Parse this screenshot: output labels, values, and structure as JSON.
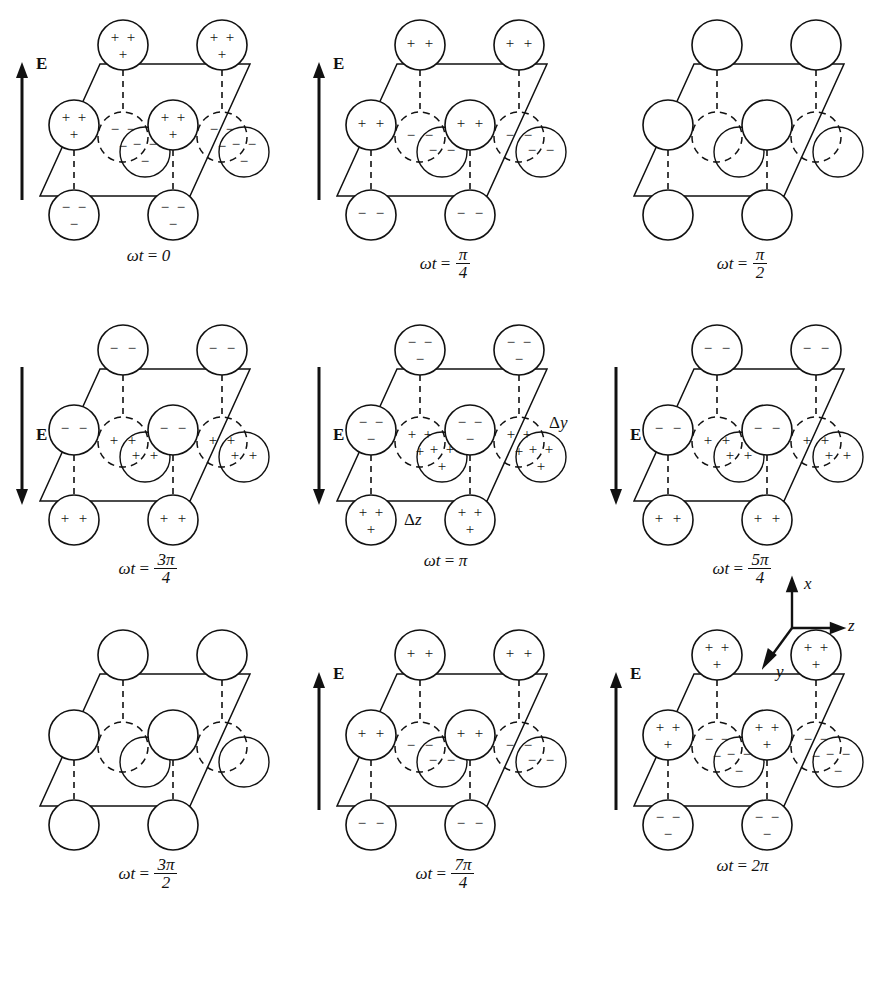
{
  "figure": {
    "type": "physics-lattice-diagram",
    "panel_count": 9,
    "rows": 3,
    "columns": 3,
    "line_color": "#111111",
    "background": "#ffffff"
  },
  "axes_triad": {
    "name": "coordinate-triad",
    "x_label": "x",
    "y_label": "y",
    "z_label": "z",
    "x_direction": "up",
    "z_direction": "right",
    "y_direction": "down-left"
  },
  "legend": {
    "field_symbol": "E",
    "delta_y": "Δy",
    "delta_z": "Δz"
  },
  "panels": [
    {
      "id": "panel-1",
      "phase_label": "ωt = 0",
      "phase_prefix": "ωt",
      "phase_eq": "=",
      "phase_value": "0",
      "phase_numerator": "",
      "phase_denominator": "",
      "field": {
        "shown": true,
        "direction": "up",
        "label": "E",
        "magnitude": "max"
      },
      "charge_magnitude": 3,
      "solid_charge": "+",
      "dashed_charge": "−",
      "solid_glyphs": [
        "+",
        "+",
        "+"
      ],
      "dashed_glyphs": [
        "−",
        "−",
        "−"
      ],
      "bottom_solid_glyphs": [
        "−",
        "−",
        "−"
      ],
      "annotations": []
    },
    {
      "id": "panel-2",
      "phase_label": "ωt = π/4",
      "phase_prefix": "ωt",
      "phase_eq": "=",
      "phase_value": "",
      "phase_numerator": "π",
      "phase_denominator": "4",
      "field": {
        "shown": true,
        "direction": "up",
        "label": "E",
        "magnitude": "mid"
      },
      "charge_magnitude": 2,
      "solid_charge": "+",
      "dashed_charge": "−",
      "solid_glyphs": [
        "+",
        "+"
      ],
      "dashed_glyphs": [
        "−",
        "−"
      ],
      "bottom_solid_glyphs": [
        "−",
        "−"
      ],
      "annotations": []
    },
    {
      "id": "panel-3",
      "phase_label": "ωt = π/2",
      "phase_prefix": "ωt",
      "phase_eq": "=",
      "phase_value": "",
      "phase_numerator": "π",
      "phase_denominator": "2",
      "field": {
        "shown": false,
        "direction": "none",
        "label": "",
        "magnitude": "zero"
      },
      "charge_magnitude": 0,
      "solid_charge": "",
      "dashed_charge": "",
      "solid_glyphs": [],
      "dashed_glyphs": [],
      "bottom_solid_glyphs": [],
      "annotations": []
    },
    {
      "id": "panel-4",
      "phase_label": "ωt = 3π/4",
      "phase_prefix": "ωt",
      "phase_eq": "=",
      "phase_value": "",
      "phase_numerator": "3π",
      "phase_denominator": "4",
      "field": {
        "shown": true,
        "direction": "down",
        "label": "E",
        "magnitude": "mid"
      },
      "charge_magnitude": 2,
      "solid_charge": "−",
      "dashed_charge": "+",
      "solid_glyphs": [
        "−",
        "−"
      ],
      "dashed_glyphs": [
        "+",
        "+"
      ],
      "bottom_solid_glyphs": [
        "+",
        "+"
      ],
      "annotations": []
    },
    {
      "id": "panel-5",
      "phase_label": "ωt = π",
      "phase_prefix": "ωt",
      "phase_eq": "=",
      "phase_value": "π",
      "phase_numerator": "",
      "phase_denominator": "",
      "field": {
        "shown": true,
        "direction": "down",
        "label": "E",
        "magnitude": "max"
      },
      "charge_magnitude": 3,
      "solid_charge": "−",
      "dashed_charge": "+",
      "solid_glyphs": [
        "−",
        "−",
        "−"
      ],
      "dashed_glyphs": [
        "+",
        "+",
        "+"
      ],
      "bottom_solid_glyphs": [
        "+",
        "+",
        "+"
      ],
      "annotations": [
        "Δy",
        "Δz"
      ]
    },
    {
      "id": "panel-6",
      "phase_label": "ωt = 5π/4",
      "phase_prefix": "ωt",
      "phase_eq": "=",
      "phase_value": "",
      "phase_numerator": "5π",
      "phase_denominator": "4",
      "field": {
        "shown": true,
        "direction": "down",
        "label": "E",
        "magnitude": "mid"
      },
      "charge_magnitude": 2,
      "solid_charge": "−",
      "dashed_charge": "+",
      "solid_glyphs": [
        "−",
        "−"
      ],
      "dashed_glyphs": [
        "+",
        "+"
      ],
      "bottom_solid_glyphs": [
        "+",
        "+"
      ],
      "annotations": []
    },
    {
      "id": "panel-7",
      "phase_label": "ωt = 3π/2",
      "phase_prefix": "ωt",
      "phase_eq": "=",
      "phase_value": "",
      "phase_numerator": "3π",
      "phase_denominator": "2",
      "field": {
        "shown": false,
        "direction": "none",
        "label": "",
        "magnitude": "zero"
      },
      "charge_magnitude": 0,
      "solid_charge": "",
      "dashed_charge": "",
      "solid_glyphs": [],
      "dashed_glyphs": [],
      "bottom_solid_glyphs": [],
      "annotations": []
    },
    {
      "id": "panel-8",
      "phase_label": "ωt = 7π/4",
      "phase_prefix": "ωt",
      "phase_eq": "=",
      "phase_value": "",
      "phase_numerator": "7π",
      "phase_denominator": "4",
      "field": {
        "shown": true,
        "direction": "up",
        "label": "E",
        "magnitude": "mid"
      },
      "charge_magnitude": 2,
      "solid_charge": "+",
      "dashed_charge": "−",
      "solid_glyphs": [
        "+",
        "+"
      ],
      "dashed_glyphs": [
        "−",
        "−"
      ],
      "bottom_solid_glyphs": [
        "−",
        "−"
      ],
      "annotations": []
    },
    {
      "id": "panel-9",
      "phase_label": "ωt = 2π",
      "phase_prefix": "ωt",
      "phase_eq": "=",
      "phase_value": "2π",
      "phase_numerator": "",
      "phase_denominator": "",
      "field": {
        "shown": true,
        "direction": "up",
        "label": "E",
        "magnitude": "max"
      },
      "charge_magnitude": 3,
      "solid_charge": "+",
      "dashed_charge": "−",
      "solid_glyphs": [
        "+",
        "+",
        "+"
      ],
      "dashed_glyphs": [
        "−",
        "−",
        "−"
      ],
      "bottom_solid_glyphs": [
        "−",
        "−",
        "−"
      ],
      "annotations": []
    }
  ]
}
